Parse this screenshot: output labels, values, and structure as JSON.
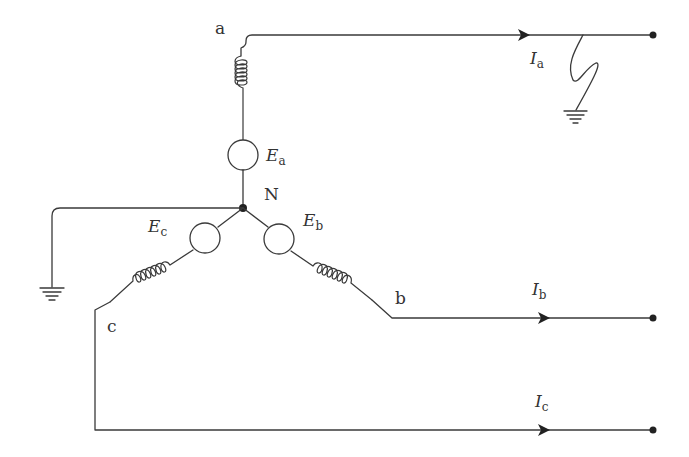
{
  "diagram": {
    "type": "three-phase wye-connected generator with single line-to-ground fault on phase a",
    "nodes": {
      "neutral": {
        "label": "N"
      },
      "phase_a": {
        "label": "a"
      },
      "phase_b": {
        "label": "b"
      },
      "phase_c": {
        "label": "c"
      }
    },
    "sources": {
      "a": {
        "symbol": "E",
        "subscript": "a"
      },
      "b": {
        "symbol": "E",
        "subscript": "b"
      },
      "c": {
        "symbol": "E",
        "subscript": "c"
      }
    },
    "currents": {
      "a": {
        "symbol": "I",
        "subscript": "a"
      },
      "b": {
        "symbol": "I",
        "subscript": "b"
      },
      "c": {
        "symbol": "I",
        "subscript": "c"
      }
    },
    "grounds": [
      "neutral-ground",
      "fault-ground"
    ],
    "fault": {
      "phase": "a",
      "kind": "line-to-ground"
    },
    "colors": {
      "line": "#3a3a3a",
      "background": "#ffffff"
    }
  }
}
